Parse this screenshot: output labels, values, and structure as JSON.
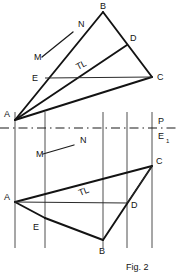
{
  "figure": {
    "caption": "Fig. 2",
    "colors": {
      "ink": "#131313",
      "thin_ink": "#2a2a2a",
      "projector": "#3a3a3a",
      "background": "#ffffff"
    },
    "reference_line": {
      "name": "fold-line",
      "label_above": "P",
      "label_below": "E",
      "label_below_subscript": "1",
      "y": 128,
      "x_start": 0,
      "x_end": 176,
      "style": "dash-dot"
    },
    "projectors": {
      "label": "vertical projector lines",
      "x_positions": [
        15,
        45,
        103,
        127,
        152
      ]
    },
    "top_view": {
      "name": "elevation-view",
      "vertices": [
        {
          "id": "A",
          "label": "A",
          "x": 15,
          "y": 120,
          "label_x": 4,
          "label_y": 117
        },
        {
          "id": "B",
          "label": "B",
          "x": 103,
          "y": 12,
          "label_x": 100,
          "label_y": 9
        },
        {
          "id": "C",
          "label": "C",
          "x": 152,
          "y": 77,
          "label_x": 157,
          "label_y": 80
        },
        {
          "id": "D",
          "label": "D",
          "x": 127,
          "y": 45,
          "label_x": 130,
          "label_y": 41
        },
        {
          "id": "E",
          "label": "E",
          "x": 45,
          "y": 78,
          "label_x": 32,
          "label_y": 81
        }
      ],
      "edges": [
        {
          "from": "A",
          "to": "B",
          "weight": "heavy"
        },
        {
          "from": "B",
          "to": "C",
          "weight": "heavy"
        },
        {
          "from": "A",
          "to": "C",
          "weight": "heavy"
        },
        {
          "from": "A",
          "to": "D",
          "weight": "heavy"
        },
        {
          "from": "E",
          "to": "C",
          "weight": "thin"
        }
      ],
      "true_length_label": {
        "text": "TL",
        "x": 78,
        "y": 70,
        "rotation": -28
      },
      "annotation": {
        "point_label": "N",
        "point_x": 78,
        "point_y": 27,
        "leader_label": "M",
        "leader_x": 34,
        "leader_y": 60,
        "leader_from_x": 42,
        "leader_from_y": 57,
        "leader_to_x": 73,
        "leader_to_y": 32
      }
    },
    "bottom_view": {
      "name": "plan-view",
      "vertices": [
        {
          "id": "A",
          "label": "A",
          "x": 15,
          "y": 202,
          "label_x": 4,
          "label_y": 200
        },
        {
          "id": "B",
          "label": "B",
          "x": 103,
          "y": 240,
          "label_x": 99,
          "label_y": 254
        },
        {
          "id": "C",
          "label": "C",
          "x": 152,
          "y": 166,
          "label_x": 156,
          "label_y": 164
        },
        {
          "id": "D",
          "label": "D",
          "x": 127,
          "y": 203,
          "label_x": 131,
          "label_y": 208
        },
        {
          "id": "E",
          "label": "E",
          "x": 45,
          "y": 218,
          "label_x": 33,
          "label_y": 230
        }
      ],
      "edges": [
        {
          "from": "A",
          "to": "C",
          "weight": "heavy"
        },
        {
          "from": "A",
          "to": "E",
          "weight": "heavy"
        },
        {
          "from": "E",
          "to": "B",
          "weight": "heavy"
        },
        {
          "from": "B",
          "to": "C",
          "weight": "heavy"
        },
        {
          "from": "A",
          "to": "D",
          "weight": "thin"
        },
        {
          "from": "D",
          "to": "C",
          "weight": "thin"
        }
      ],
      "true_length_label": {
        "text": "TL",
        "x": 80,
        "y": 196,
        "rotation": -22
      },
      "annotation": {
        "point_label": "N",
        "point_x": 80,
        "point_y": 143,
        "leader_label": "M",
        "leader_x": 36,
        "leader_y": 157,
        "leader_from_x": 43,
        "leader_from_y": 154,
        "leader_to_x": 74,
        "leader_to_y": 145
      }
    }
  }
}
